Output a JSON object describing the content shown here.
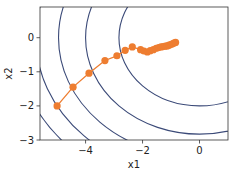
{
  "chart_data": {
    "type": "line",
    "title": "",
    "xlabel": "x1",
    "ylabel": "x2",
    "xlim": [
      -5.6,
      1.0
    ],
    "ylim": [
      -3.0,
      0.9
    ],
    "xticks": [
      -4,
      -2,
      0
    ],
    "xtick_labels": [
      "−4",
      "−2",
      "0"
    ],
    "yticks": [
      0,
      -1,
      -2,
      -3
    ],
    "ytick_labels": [
      "0",
      "−1",
      "−2",
      "−3"
    ],
    "grid": false,
    "legend": null,
    "contour": {
      "function": "x1^2 + 2*x2^2",
      "center": [
        0,
        0
      ],
      "levels": [
        8,
        16,
        24.5,
        33,
        41.5
      ],
      "color": "#3b4a78"
    },
    "series": [
      {
        "name": "trajectory",
        "color": "#ee7d30",
        "marker": "circle",
        "points": [
          [
            -5.0,
            -2.0
          ],
          [
            -4.44,
            -1.45
          ],
          [
            -3.88,
            -1.04
          ],
          [
            -3.32,
            -0.67
          ],
          [
            -2.9,
            -0.53
          ],
          [
            -2.61,
            -0.37
          ],
          [
            -2.36,
            -0.27
          ],
          [
            -2.07,
            -0.35
          ],
          [
            -1.95,
            -0.39
          ],
          [
            -1.83,
            -0.42
          ],
          [
            -1.73,
            -0.38
          ],
          [
            -1.62,
            -0.35
          ],
          [
            -1.52,
            -0.31
          ],
          [
            -1.43,
            -0.29
          ],
          [
            -1.35,
            -0.27
          ],
          [
            -1.27,
            -0.26
          ],
          [
            -1.2,
            -0.25
          ],
          [
            -1.13,
            -0.24
          ],
          [
            -1.07,
            -0.22
          ],
          [
            -1.01,
            -0.2
          ],
          [
            -0.95,
            -0.18
          ],
          [
            -0.9,
            -0.16
          ],
          [
            -0.84,
            -0.14
          ]
        ]
      }
    ]
  }
}
